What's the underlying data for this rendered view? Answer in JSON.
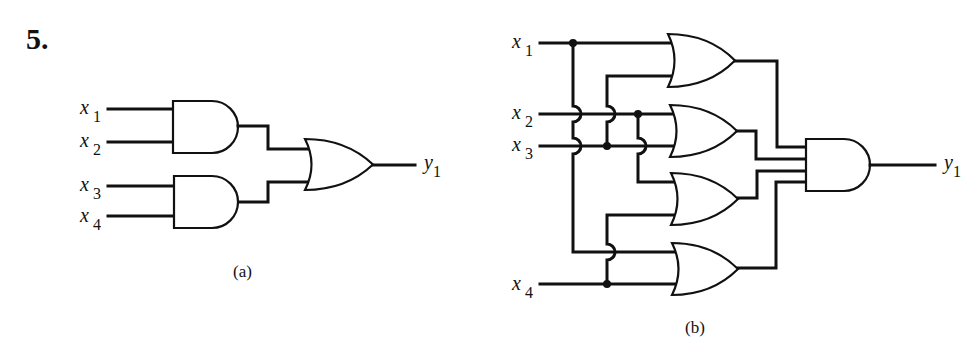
{
  "problem": {
    "number": "5."
  },
  "circuit_a": {
    "caption": "(a)",
    "inputs": [
      {
        "var": "x",
        "sub": "1"
      },
      {
        "var": "x",
        "sub": "2"
      },
      {
        "var": "x",
        "sub": "3"
      },
      {
        "var": "x",
        "sub": "4"
      }
    ],
    "output": {
      "var": "y",
      "sub": "1"
    },
    "gates": [
      {
        "type": "AND",
        "inputs": [
          "x1",
          "x2"
        ]
      },
      {
        "type": "AND",
        "inputs": [
          "x3",
          "x4"
        ]
      },
      {
        "type": "OR",
        "inputs": [
          "AND1",
          "AND2"
        ],
        "drives": "y1"
      }
    ]
  },
  "circuit_b": {
    "caption": "(b)",
    "inputs": [
      {
        "var": "x",
        "sub": "1"
      },
      {
        "var": "x",
        "sub": "2"
      },
      {
        "var": "x",
        "sub": "3"
      },
      {
        "var": "x",
        "sub": "4"
      }
    ],
    "output": {
      "var": "y",
      "sub": "1"
    },
    "gates": [
      {
        "type": "OR",
        "inputs": [
          "x1",
          "x3"
        ]
      },
      {
        "type": "OR",
        "inputs": [
          "x2",
          "x3"
        ]
      },
      {
        "type": "OR",
        "inputs": [
          "x2",
          "x4"
        ]
      },
      {
        "type": "OR",
        "inputs": [
          "x1",
          "x4"
        ]
      },
      {
        "type": "AND",
        "inputs": [
          "OR1",
          "OR2",
          "OR3",
          "OR4"
        ],
        "drives": "y1"
      }
    ]
  }
}
